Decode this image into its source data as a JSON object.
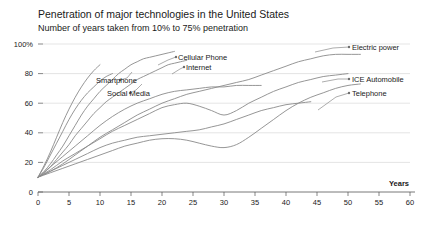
{
  "chart_data": {
    "type": "line",
    "title": "Penetration of major technologies in the United States",
    "subtitle": "Number of years taken from 10% to 75% penetration",
    "xlabel": "Years",
    "ylabel": "",
    "xlim": [
      0,
      60
    ],
    "ylim": [
      0,
      100
    ],
    "grid": true,
    "legend_position": "inline-right-labels",
    "xticks": [
      "0",
      "5",
      "10",
      "15",
      "20",
      "25",
      "30",
      "35",
      "40",
      "45",
      "50",
      "55",
      "60"
    ],
    "xtick_values": [
      0,
      5,
      10,
      15,
      20,
      25,
      30,
      35,
      40,
      45,
      50,
      55,
      60
    ],
    "yticks": [
      "0",
      "20",
      "40",
      "60",
      "80",
      "100%"
    ],
    "ytick_values": [
      0,
      20,
      40,
      60,
      80,
      100
    ],
    "series": [
      {
        "name": "Electric power",
        "label_x": 352,
        "label_y": 47,
        "leader": "M 315 52 L 333 48 L 349 47",
        "x": [
          0,
          2,
          4,
          6,
          8,
          10,
          12,
          14,
          16,
          18,
          20,
          22,
          24,
          26,
          28,
          30,
          32,
          34,
          36,
          38,
          40,
          42,
          44,
          46,
          48,
          50,
          52
        ],
        "values": [
          10,
          14,
          19,
          25,
          31,
          37,
          42,
          47,
          52,
          56,
          60,
          63,
          66,
          68,
          70,
          72,
          74,
          76,
          79,
          82,
          85,
          88,
          90,
          92,
          93,
          93,
          93
        ]
      },
      {
        "name": "ICE Automobile",
        "label_x": 352,
        "label_y": 79,
        "leader": "M 322 82 L 338 79 L 349 79",
        "x": [
          0,
          2,
          4,
          6,
          8,
          10,
          12,
          14,
          16,
          18,
          20,
          22,
          24,
          26,
          28,
          30,
          32,
          34,
          36,
          38,
          40,
          42,
          44,
          46,
          48,
          50
        ],
        "values": [
          10,
          15,
          21,
          26,
          31,
          36,
          41,
          45,
          49,
          53,
          57,
          59,
          60,
          58,
          55,
          52,
          55,
          60,
          64,
          68,
          71,
          74,
          76,
          78,
          79,
          80
        ]
      },
      {
        "name": "Telephone",
        "label_x": 352,
        "label_y": 93,
        "leader": "M 318 110 L 336 97 L 349 93",
        "x": [
          0,
          2,
          4,
          6,
          8,
          10,
          12,
          14,
          16,
          18,
          20,
          22,
          24,
          26,
          28,
          30,
          32,
          34,
          36,
          38,
          40,
          42,
          44,
          46,
          48,
          50,
          52
        ],
        "values": [
          10,
          13,
          16,
          19,
          22,
          25,
          28,
          31,
          33,
          35,
          36,
          36,
          35,
          33,
          31,
          30,
          32,
          37,
          43,
          49,
          55,
          60,
          64,
          67,
          70,
          72,
          73
        ]
      },
      {
        "name": "Cellular Phone",
        "label_x": 178,
        "label_y": 57,
        "leader": "M 158 65 L 168 60 L 176 57",
        "x": [
          0,
          1,
          2,
          3,
          4,
          5,
          6,
          7,
          8,
          9,
          10,
          11,
          12,
          13,
          14,
          15,
          16,
          17,
          18,
          19,
          20,
          21,
          22
        ],
        "values": [
          10,
          14,
          19,
          25,
          31,
          38,
          45,
          52,
          58,
          63,
          68,
          72,
          76,
          80,
          83,
          86,
          88,
          90,
          91,
          92,
          93,
          94,
          95
        ]
      },
      {
        "name": "Internet",
        "label_x": 186,
        "label_y": 67,
        "leader": "M 172 74 L 180 69 L 184 67",
        "x": [
          0,
          1,
          2,
          3,
          4,
          5,
          6,
          7,
          8,
          9,
          10,
          11,
          12,
          13,
          14,
          15,
          16,
          17,
          18,
          19,
          20,
          21,
          22,
          23,
          24
        ],
        "values": [
          10,
          13,
          17,
          22,
          27,
          32,
          38,
          43,
          48,
          53,
          57,
          61,
          64,
          67,
          70,
          73,
          76,
          78,
          80,
          82,
          84,
          86,
          87,
          88,
          89
        ]
      },
      {
        "name": "Smartphone",
        "label_x": 96,
        "label_y": 80,
        "leader": "M 132 72 L 127 78 L 120 80",
        "x": [
          0,
          1,
          2,
          3,
          4,
          5,
          6,
          7,
          8,
          9,
          10
        ],
        "values": [
          10,
          18,
          27,
          37,
          47,
          56,
          64,
          71,
          77,
          82,
          86
        ]
      },
      {
        "name": "Social Media",
        "label_x": 107,
        "label_y": 93,
        "leader": "M 142 84 L 136 90 L 130 93",
        "x": [
          0,
          1,
          2,
          3,
          4,
          5,
          6,
          7,
          8,
          9,
          10,
          11,
          12
        ],
        "values": [
          10,
          17,
          25,
          33,
          41,
          49,
          56,
          62,
          67,
          71,
          75,
          78,
          80
        ]
      },
      {
        "name": "unlabeled-early-line-a",
        "x": [
          0,
          2,
          4,
          6,
          8,
          10,
          12,
          14,
          16,
          18,
          20,
          22,
          24,
          26,
          28,
          30,
          32,
          34,
          36
        ],
        "values": [
          10,
          17,
          24,
          31,
          38,
          45,
          51,
          56,
          60,
          63,
          66,
          68,
          69,
          70,
          71,
          71,
          72,
          72,
          72
        ]
      },
      {
        "name": "unlabeled-early-line-b",
        "x": [
          0,
          2,
          4,
          6,
          8,
          10,
          12,
          14,
          16,
          18,
          20,
          22,
          24,
          26,
          28,
          30,
          32,
          34,
          36,
          38,
          40,
          42,
          44
        ],
        "values": [
          10,
          14,
          18,
          22,
          26,
          30,
          33,
          35,
          37,
          38,
          39,
          40,
          41,
          42,
          44,
          46,
          49,
          52,
          55,
          57,
          59,
          60,
          61
        ]
      }
    ]
  }
}
